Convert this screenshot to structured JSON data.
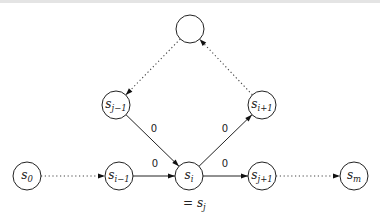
{
  "diagram": {
    "nodes": [
      {
        "id": "top",
        "base": "",
        "sub": ""
      },
      {
        "id": "sj_1",
        "base": "s",
        "sub": "j−1"
      },
      {
        "id": "si_1p",
        "base": "s",
        "sub": "i+1"
      },
      {
        "id": "s0",
        "base": "s",
        "sub": "0"
      },
      {
        "id": "si_1",
        "base": "s",
        "sub": "i−1"
      },
      {
        "id": "si",
        "base": "s",
        "sub": "i"
      },
      {
        "id": "sj1",
        "base": "s",
        "sub": "j+1"
      },
      {
        "id": "sm",
        "base": "s",
        "sub": "m"
      }
    ],
    "edges": [
      {
        "from": "s0",
        "to": "si_1",
        "style": "dotted",
        "label": ""
      },
      {
        "from": "si_1",
        "to": "si",
        "style": "solid",
        "label": "0"
      },
      {
        "from": "si",
        "to": "sj1",
        "style": "solid",
        "label": "0"
      },
      {
        "from": "sj1",
        "to": "sm",
        "style": "dotted",
        "label": ""
      },
      {
        "from": "sj_1",
        "to": "si",
        "style": "solid",
        "label": "0"
      },
      {
        "from": "si",
        "to": "si_1p",
        "style": "solid",
        "label": "0"
      },
      {
        "from": "si_1p",
        "to": "top",
        "style": "dotted",
        "label": ""
      },
      {
        "from": "top",
        "to": "sj_1",
        "style": "dotted",
        "label": ""
      }
    ],
    "annotation": {
      "prefix": "= ",
      "base": "s",
      "sub": "j"
    }
  }
}
